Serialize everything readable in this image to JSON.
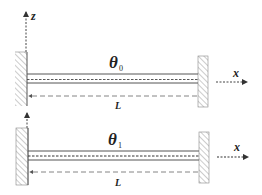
{
  "diagram": {
    "colors": {
      "line": "#555555",
      "hatch": "#888888",
      "text": "#222222"
    },
    "top": {
      "axis_z_label": "z",
      "axis_x_label": "x",
      "angle_symbol": "θ",
      "angle_subscript": "0",
      "length_label": "L"
    },
    "bottom": {
      "axis_x_label": "x",
      "angle_symbol": "θ",
      "angle_subscript": "1",
      "length_label": "L"
    }
  }
}
